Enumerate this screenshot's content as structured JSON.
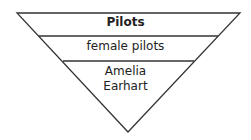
{
  "diagram": {
    "type": "inverted-pyramid",
    "levels": [
      {
        "label": "Pilots",
        "bold": true
      },
      {
        "label": "female pilots",
        "bold": false
      },
      {
        "label_line1": "Amelia",
        "label_line2": "Earhart",
        "bold": false
      }
    ],
    "line_color": "#333333"
  }
}
